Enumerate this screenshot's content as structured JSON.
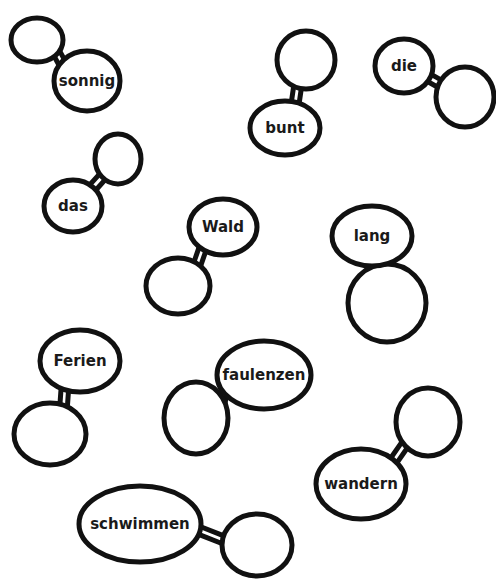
{
  "colors": {
    "background": "#ffffff",
    "stroke": "#111111",
    "text": "#1a1a1a"
  },
  "words": [
    {
      "label": "sonnig",
      "label_bubble": {
        "cx": 87,
        "cy": 81,
        "rx": 33,
        "ry": 30
      },
      "empty_bubble": {
        "cx": 37,
        "cy": 40,
        "rx": 26,
        "ry": 22
      }
    },
    {
      "label": "bunt",
      "label_bubble": {
        "cx": 285,
        "cy": 128,
        "rx": 35,
        "ry": 27
      },
      "empty_bubble": {
        "cx": 306,
        "cy": 60,
        "rx": 29,
        "ry": 29
      }
    },
    {
      "label": "die",
      "label_bubble": {
        "cx": 404,
        "cy": 66,
        "rx": 29,
        "ry": 27
      },
      "empty_bubble": {
        "cx": 465,
        "cy": 97,
        "rx": 29,
        "ry": 30
      }
    },
    {
      "label": "das",
      "label_bubble": {
        "cx": 73,
        "cy": 206,
        "rx": 29,
        "ry": 26
      },
      "empty_bubble": {
        "cx": 118,
        "cy": 159,
        "rx": 23,
        "ry": 25
      }
    },
    {
      "label": "Wald",
      "label_bubble": {
        "cx": 223,
        "cy": 227,
        "rx": 34,
        "ry": 28
      },
      "empty_bubble": {
        "cx": 178,
        "cy": 286,
        "rx": 32,
        "ry": 28
      }
    },
    {
      "label": "lang",
      "label_bubble": {
        "cx": 372,
        "cy": 236,
        "rx": 40,
        "ry": 30
      },
      "empty_bubble": {
        "cx": 387,
        "cy": 303,
        "rx": 39,
        "ry": 39
      }
    },
    {
      "label": "Ferien",
      "label_bubble": {
        "cx": 80,
        "cy": 361,
        "rx": 40,
        "ry": 31
      },
      "empty_bubble": {
        "cx": 50,
        "cy": 434,
        "rx": 36,
        "ry": 31
      }
    },
    {
      "label": "faulenzen",
      "label_bubble": {
        "cx": 264,
        "cy": 375,
        "rx": 47,
        "ry": 34
      },
      "empty_bubble": {
        "cx": 196,
        "cy": 418,
        "rx": 32,
        "ry": 36
      }
    },
    {
      "label": "wandern",
      "label_bubble": {
        "cx": 361,
        "cy": 484,
        "rx": 45,
        "ry": 35
      },
      "empty_bubble": {
        "cx": 428,
        "cy": 422,
        "rx": 32,
        "ry": 34
      }
    },
    {
      "label": "schwimmen",
      "label_bubble": {
        "cx": 140,
        "cy": 524,
        "rx": 61,
        "ry": 38
      },
      "empty_bubble": {
        "cx": 257,
        "cy": 545,
        "rx": 35,
        "ry": 31
      }
    }
  ]
}
